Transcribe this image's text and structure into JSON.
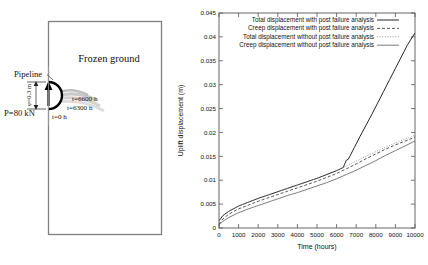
{
  "figure": {
    "left_panel": {
      "name": "frozen-ground-schematic",
      "ground_label": "Frozen ground",
      "pipeline_label": "Pipeline",
      "diameter_label": "φ=0.3 m",
      "load_label": "P=80 kN",
      "time_labels": [
        {
          "text": "t=6600 h"
        },
        {
          "text": "t=6300 h"
        },
        {
          "text": "t=0 h"
        }
      ],
      "colors": {
        "box_stroke": "#808080",
        "pipe_stroke": "#000000",
        "deformation": "#b8b8b8",
        "text": "#111111"
      }
    },
    "right_panel": {
      "name": "uplift-displacement-plot"
    }
  },
  "chart_data": {
    "type": "line",
    "title": "",
    "xlabel": "Time (hours)",
    "ylabel": "Uplift displacement (m)",
    "xlim": [
      0,
      10000
    ],
    "ylim": [
      0,
      0.045
    ],
    "xticks": [
      0,
      1000,
      2000,
      3000,
      4000,
      5000,
      6000,
      7000,
      8000,
      9000,
      10000
    ],
    "xticklabels": [
      "0",
      "1000",
      "2000",
      "3000",
      "4000",
      "5000",
      "6000",
      "7000",
      "8000",
      "9000",
      "10000"
    ],
    "yticks": [
      0,
      0.005,
      0.01,
      0.015,
      0.02,
      0.025,
      0.03,
      0.035,
      0.04,
      0.045
    ],
    "yticklabels": [
      "0",
      "0.005",
      "0.01",
      "0.015",
      "0.02",
      "0.025",
      "0.03",
      "0.035",
      "0.04",
      "0.045"
    ],
    "grid": false,
    "legend_position": "top-right",
    "series": [
      {
        "name": "Total displacement with post failure analysis",
        "style": "solid",
        "color": "#1a1a1a",
        "x": [
          0,
          200,
          500,
          1000,
          1500,
          2000,
          2500,
          3000,
          3500,
          4000,
          4500,
          5000,
          5500,
          6000,
          6200,
          6350,
          6400,
          6500,
          6600,
          6700,
          6900,
          7200,
          7500,
          7800,
          8100,
          8400,
          8700,
          9000,
          9300,
          9600,
          9900,
          10000
        ],
        "y": [
          0.0015,
          0.0026,
          0.0035,
          0.0046,
          0.0054,
          0.0062,
          0.0069,
          0.0076,
          0.0083,
          0.009,
          0.0097,
          0.0104,
          0.0112,
          0.012,
          0.0124,
          0.0127,
          0.0133,
          0.0142,
          0.0144,
          0.0152,
          0.0168,
          0.0192,
          0.0215,
          0.0238,
          0.0262,
          0.0286,
          0.031,
          0.0334,
          0.0358,
          0.0382,
          0.0402,
          0.0408
        ]
      },
      {
        "name": "Creep displacement with post failure analysis",
        "style": "dashed",
        "color": "#3a3a3a",
        "x": [
          0,
          200,
          500,
          1000,
          1500,
          2000,
          2500,
          3000,
          3500,
          4000,
          4500,
          5000,
          5500,
          6000,
          6500,
          7000,
          7500,
          8000,
          8500,
          9000,
          9500,
          10000
        ],
        "y": [
          0.0008,
          0.0019,
          0.0029,
          0.004,
          0.0048,
          0.0056,
          0.0063,
          0.007,
          0.0077,
          0.0084,
          0.0091,
          0.0098,
          0.0106,
          0.0114,
          0.0124,
          0.0134,
          0.0145,
          0.0155,
          0.0165,
          0.0174,
          0.0182,
          0.019
        ]
      },
      {
        "name": "Total displacement without post failure analysis",
        "style": "dotted",
        "color": "#8a8a8a",
        "x": [
          0,
          200,
          500,
          1000,
          1500,
          2000,
          2500,
          3000,
          3500,
          4000,
          4500,
          5000,
          5500,
          6000,
          6500,
          7000,
          7500,
          8000,
          8500,
          9000,
          9500,
          10000
        ],
        "y": [
          0.0015,
          0.0026,
          0.0035,
          0.0046,
          0.0054,
          0.0062,
          0.0069,
          0.0076,
          0.0083,
          0.009,
          0.0097,
          0.0104,
          0.0112,
          0.012,
          0.013,
          0.014,
          0.015,
          0.016,
          0.0169,
          0.0178,
          0.0186,
          0.0194
        ]
      },
      {
        "name": "Creep displacement without post failure analysis",
        "style": "solid-light",
        "color": "#5a5a5a",
        "x": [
          0,
          200,
          500,
          1000,
          1500,
          2000,
          2500,
          3000,
          3500,
          4000,
          4500,
          5000,
          5500,
          6000,
          6500,
          7000,
          7500,
          8000,
          8500,
          9000,
          9500,
          10000
        ],
        "y": [
          0.0006,
          0.0014,
          0.0022,
          0.0032,
          0.004,
          0.0047,
          0.0054,
          0.0061,
          0.0068,
          0.0074,
          0.0081,
          0.0088,
          0.0095,
          0.0103,
          0.0112,
          0.0121,
          0.0131,
          0.0141,
          0.0152,
          0.0162,
          0.0172,
          0.0182
        ]
      }
    ]
  }
}
